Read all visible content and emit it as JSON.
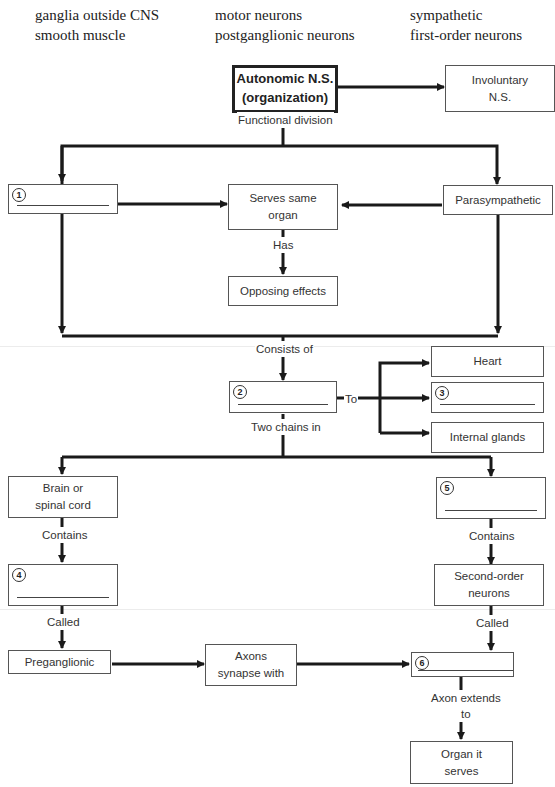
{
  "word_bank": {
    "columns": [
      [
        "ganglia outside CNS",
        "smooth muscle"
      ],
      [
        "motor neurons",
        "postganglionic neurons"
      ],
      [
        "sympathetic",
        "first-order neurons"
      ]
    ]
  },
  "nodes": {
    "root": "Autonomic N.S.\n(organization)",
    "involuntary": "Involuntary\nN.S.",
    "blank1": {
      "number": "1",
      "value": ""
    },
    "serves_same_organ": "Serves same\norgan",
    "parasympathetic": "Parasympathetic",
    "opposing_effects": "Opposing effects",
    "blank2": {
      "number": "2",
      "value": ""
    },
    "heart": "Heart",
    "blank3": {
      "number": "3",
      "value": ""
    },
    "internal_glands": "Internal glands",
    "brain_spinal": "Brain or\nspinal cord",
    "blank5": {
      "number": "5",
      "value": ""
    },
    "blank4": {
      "number": "4",
      "value": ""
    },
    "second_order": "Second-order\nneurons",
    "preganglionic": "Preganglionic",
    "axons_synapse": "Axons\nsynapse with",
    "blank6": {
      "number": "6",
      "value": ""
    },
    "organ_serves": "Organ it\nserves"
  },
  "edge_labels": {
    "functional_division": "Functional division",
    "has": "Has",
    "consists_of": "Consists of",
    "to": "To",
    "two_chains_in": "Two chains in",
    "contains_left": "Contains",
    "contains_right": "Contains",
    "called_left": "Called",
    "called_right": "Called",
    "axon_extends_to": "Axon extends\nto"
  }
}
